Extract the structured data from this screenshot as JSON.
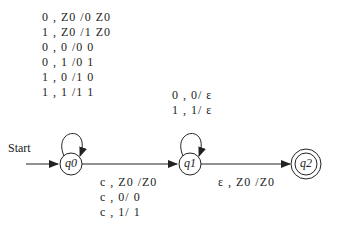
{
  "diagram": {
    "type": "pushdown-automaton",
    "start_label": "Start",
    "states": [
      {
        "id": "q0",
        "label": "q0",
        "start": true,
        "accepting": false
      },
      {
        "id": "q1",
        "label": "q1",
        "start": false,
        "accepting": false
      },
      {
        "id": "q2",
        "label": "q2",
        "start": false,
        "accepting": true
      }
    ],
    "transitions": {
      "q0_loop": [
        "0 , Z0 /0 Z0",
        "1 , Z0 /1 Z0",
        "0 , 0 /0 0",
        "0 , 1 /0 1",
        "1 , 0 /1 0",
        "1 , 1 /1 1"
      ],
      "q1_loop": [
        "0 , 0/ ε",
        "1 , 1/ ε"
      ],
      "q0_to_q1": [
        "c , Z0 /Z0",
        "c , 0/ 0",
        "c , 1/ 1"
      ],
      "q1_to_q2": [
        "ε , Z0 /Z0"
      ]
    }
  }
}
